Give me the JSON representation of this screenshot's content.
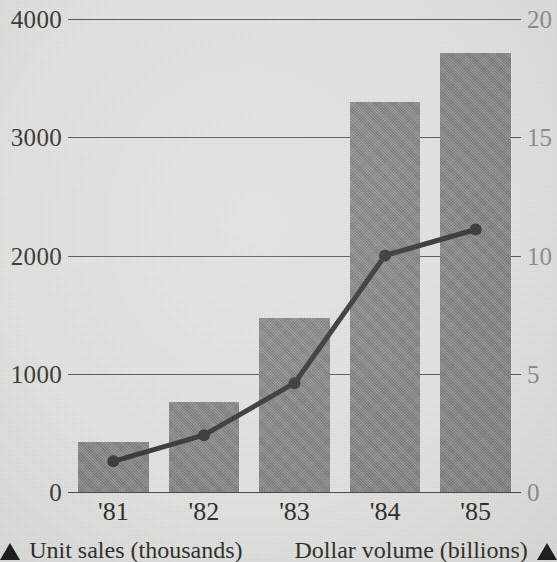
{
  "chart_data": {
    "type": "bar",
    "title": "",
    "xlabel": "",
    "categories": [
      "'81",
      "'82",
      "'83",
      "'84",
      "'85"
    ],
    "grid": true,
    "legend_position": "bottom",
    "series": [
      {
        "name": "Unit sales (thousands)",
        "type": "bar",
        "axis": "left",
        "values": [
          420,
          760,
          1470,
          3300,
          3710
        ],
        "color": "#8d8d8d"
      },
      {
        "name": "Dollar volume (billions)",
        "type": "line",
        "axis": "right",
        "values": [
          1.3,
          2.4,
          4.6,
          10.0,
          11.1
        ],
        "color": "#3c3c3c"
      }
    ],
    "left_axis": {
      "label": "Unit sales (thousands)",
      "ticks": [
        "4000",
        "3000",
        "2000",
        "1000",
        "0"
      ],
      "tick_values": [
        4000,
        3000,
        2000,
        1000,
        0
      ],
      "ylim": [
        0,
        4000
      ],
      "color": "#3b3b3b"
    },
    "right_axis": {
      "label": "Dollar volume (billions)",
      "ticks": [
        "20",
        "15",
        "10",
        "5",
        "0"
      ],
      "tick_values": [
        20,
        15,
        10,
        5,
        0
      ],
      "ylim": [
        0,
        20
      ],
      "color": "#8f8f8f"
    }
  },
  "legend": {
    "left": {
      "marker": "triangle-up-icon",
      "label": "Unit sales (thousands)"
    },
    "right": {
      "marker": "triangle-up-icon",
      "label": "Dollar volume (billions)"
    }
  },
  "colors": {
    "background": "#e3e3e1",
    "bar_fill": "#8d8d8d",
    "line": "#3c3c3c",
    "gridline": "#5c5c5c",
    "text_dark": "#2f2f2f",
    "text_light": "#8f8f8f"
  }
}
